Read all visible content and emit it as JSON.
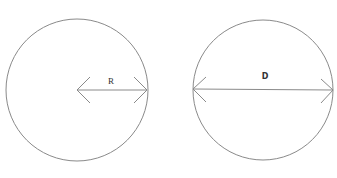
{
  "figures": [
    {
      "name": "radius",
      "label": "R",
      "description": "Circle with arrow from center to edge"
    },
    {
      "name": "diameter",
      "label": "D",
      "description": "Circle with arrow spanning full width"
    }
  ],
  "colors": {
    "stroke": "#8a8a8a",
    "text": "#333333",
    "background": "#ffffff"
  }
}
